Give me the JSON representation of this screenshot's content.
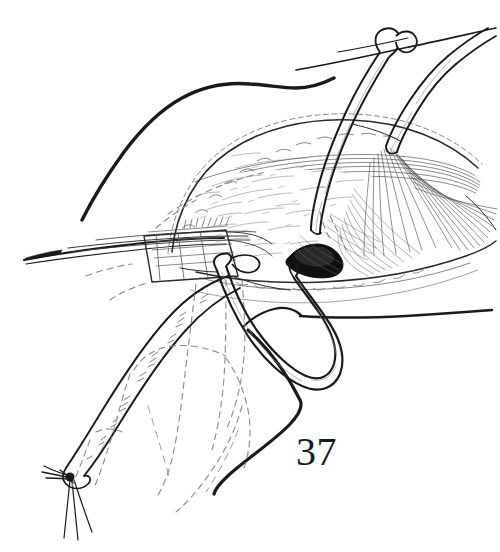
{
  "figure": {
    "number": "37",
    "caption_text": "37",
    "type": "surgical-line-illustration",
    "background_color": "#ffffff",
    "ink_color": "#1a1a1a",
    "hatch_color": "#4a4a4a",
    "dashed_color": "#8a8a8a",
    "shadow_fill": "#101010"
  },
  "canvas": {
    "width": 500,
    "height": 552
  },
  "elements": {
    "skin_contour": {
      "name": "skin-edge-contour",
      "description": "Bold outer skin contour sweeping from upper left down across the lower right"
    },
    "incision": {
      "name": "incision-opening",
      "description": "Scalloped wound edges exposing underlying tissue"
    },
    "vessel_loop_upper": {
      "name": "vessel-loop-upper",
      "description": "Tubular vessel loop with knotted ends at top of field"
    },
    "vessel_loop_lower": {
      "name": "vessel-loop-lower",
      "description": "U-shaped vessel loop passing through the arteriotomy"
    },
    "instrument": {
      "name": "surgical-forceps",
      "description": "Pointed surgical instrument entering from left"
    },
    "graft": {
      "name": "ligated-vessel-graft",
      "description": "Tubular vessel graft running to lower left, tied with suture tails"
    },
    "arteriotomy": {
      "name": "arteriotomy-shadow",
      "description": "Dark shaded vessel opening at center"
    },
    "hidden_structures": {
      "name": "hidden-structure-dashed-outline",
      "description": "Dashed lines indicating subcutaneous structures"
    },
    "fascia": {
      "name": "fascia-fan-hatching",
      "description": "Fan-shaped fine hatching on right depicting fibrous tissue"
    }
  }
}
